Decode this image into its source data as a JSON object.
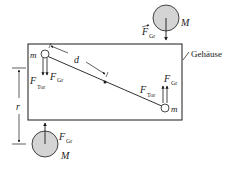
{
  "diagram": {
    "colors": {
      "line": "#1a1a1a",
      "mass_fill": "#d4d4d4",
      "background": "#ffffff"
    },
    "labels": {
      "housing": "Gehäuse",
      "large_mass": "M",
      "small_mass": "m",
      "distance_d": "d",
      "distance_r": "r",
      "force_base": "F",
      "force_gr_sub": "Gr",
      "force_tor_sub": "Tor"
    }
  }
}
